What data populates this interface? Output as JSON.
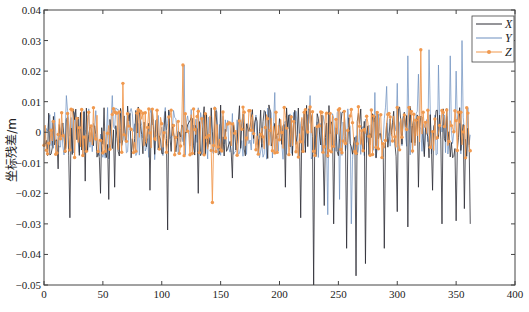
{
  "chart_data": {
    "type": "line",
    "title": "",
    "xlabel": "",
    "ylabel": "坐标残差/m",
    "xlim": [
      0,
      400
    ],
    "ylim": [
      -0.05,
      0.04
    ],
    "x_ticks": [
      0,
      50,
      100,
      150,
      200,
      250,
      300,
      350,
      400
    ],
    "x_tick_labels": [
      "0",
      "50",
      "100",
      "150",
      "200",
      "250",
      "300",
      "350",
      "400"
    ],
    "y_ticks": [
      0.04,
      0.03,
      0.02,
      0.01,
      0,
      -0.01,
      -0.02,
      -0.03,
      -0.04,
      -0.05
    ],
    "y_tick_labels": [
      "0.04",
      "0.03",
      "0.02",
      "0.01",
      "0",
      "-0.01",
      "-0.02",
      "-0.03",
      "-0.04",
      "-0.05"
    ],
    "grid": false,
    "legend_position": "upper-right",
    "n_points": 363,
    "series": [
      {
        "name": "X",
        "color": "#2b2b33",
        "marker": "none",
        "noise_amplitude": 0.009,
        "seed": 11,
        "spikes": [
          [
            12,
            -0.012
          ],
          [
            22,
            -0.028
          ],
          [
            35,
            -0.016
          ],
          [
            48,
            -0.02
          ],
          [
            55,
            -0.022
          ],
          [
            60,
            -0.018
          ],
          [
            90,
            -0.019
          ],
          [
            105,
            -0.032
          ],
          [
            131,
            -0.02
          ],
          [
            160,
            -0.015
          ],
          [
            205,
            -0.018
          ],
          [
            218,
            -0.028
          ],
          [
            229,
            -0.05
          ],
          [
            238,
            -0.024
          ],
          [
            246,
            -0.03
          ],
          [
            257,
            -0.038
          ],
          [
            265,
            -0.047
          ],
          [
            273,
            -0.043
          ],
          [
            289,
            -0.038
          ],
          [
            300,
            -0.026
          ],
          [
            309,
            -0.031
          ],
          [
            318,
            -0.018
          ],
          [
            330,
            -0.019
          ],
          [
            338,
            -0.03
          ],
          [
            350,
            -0.029
          ],
          [
            357,
            -0.025
          ],
          [
            362,
            -0.03
          ]
        ]
      },
      {
        "name": "Y",
        "color": "#6d8fbf",
        "marker": "none",
        "noise_amplitude": 0.009,
        "seed": 23,
        "spikes": [
          [
            19,
            0.012
          ],
          [
            58,
            0.012
          ],
          [
            119,
            0.022
          ],
          [
            196,
            0.013
          ],
          [
            226,
            0.012
          ],
          [
            241,
            -0.027
          ],
          [
            251,
            -0.022
          ],
          [
            261,
            -0.03
          ],
          [
            281,
            0.013
          ],
          [
            291,
            0.015
          ],
          [
            300,
            0.016
          ],
          [
            309,
            0.025
          ],
          [
            318,
            0.019
          ],
          [
            327,
            0.027
          ],
          [
            335,
            0.022
          ],
          [
            345,
            0.025
          ],
          [
            350,
            0.02
          ],
          [
            355,
            0.03
          ],
          [
            358,
            -0.009
          ]
        ]
      },
      {
        "name": "Z",
        "color": "#f0994f",
        "marker": "circle",
        "noise_amplitude": 0.0085,
        "seed": 37,
        "spikes": [
          [
            67,
            0.016
          ],
          [
            118,
            0.022
          ],
          [
            143,
            -0.023
          ],
          [
            320,
            0.027
          ]
        ]
      }
    ]
  },
  "legend": {
    "items": [
      {
        "label": "X",
        "color": "#2b2b33",
        "marker": "none"
      },
      {
        "label": "Y",
        "color": "#6d8fbf",
        "marker": "none"
      },
      {
        "label": "Z",
        "color": "#f0994f",
        "marker": "circle"
      }
    ]
  },
  "axes": {
    "ylabel": "坐标残差/m"
  }
}
